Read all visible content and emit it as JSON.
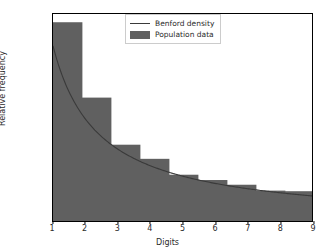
{
  "chart_data": {
    "type": "bar",
    "title": "",
    "xlabel": "Digits",
    "ylabel": "Relative frequency",
    "xlim": [
      1,
      9
    ],
    "ylim": [
      0.0,
      0.355
    ],
    "grid": false,
    "legend_position": "upper center",
    "xticks": [
      "1",
      "2",
      "3",
      "4",
      "5",
      "6",
      "7",
      "8",
      "9"
    ],
    "xtick_values": [
      1,
      2,
      3,
      4,
      5,
      6,
      7,
      8,
      9
    ],
    "yticks": [
      "0.00",
      "0.05",
      "0.10",
      "0.15",
      "0.20",
      "0.25",
      "0.30",
      "0.35"
    ],
    "ytick_values": [
      0.0,
      0.05,
      0.1,
      0.15,
      0.2,
      0.25,
      0.3,
      0.35
    ],
    "categories": [
      "1",
      "2",
      "3",
      "4",
      "5",
      "6",
      "7",
      "8",
      "9"
    ],
    "series": [
      {
        "name": "Population data",
        "type": "bar",
        "color": "#606060",
        "values": [
          0.341,
          0.213,
          0.133,
          0.109,
          0.082,
          0.073,
          0.065,
          0.055,
          0.054
        ]
      },
      {
        "name": "Benford density",
        "type": "line",
        "color": "#3a3a3a",
        "x": [
          1,
          2,
          3,
          4,
          5,
          6,
          7,
          8,
          9
        ],
        "values": [
          0.301,
          0.176,
          0.125,
          0.097,
          0.079,
          0.067,
          0.058,
          0.051,
          0.046
        ]
      }
    ]
  },
  "legend": {
    "entries": [
      {
        "label": "Benford density",
        "marker": "line"
      },
      {
        "label": "Population data",
        "marker": "patch"
      }
    ]
  },
  "colors": {
    "bar_fill": "#606060",
    "line": "#3a3a3a",
    "axis": "#000000",
    "background": "#ffffff",
    "tick_text": "#2b2b2b"
  }
}
